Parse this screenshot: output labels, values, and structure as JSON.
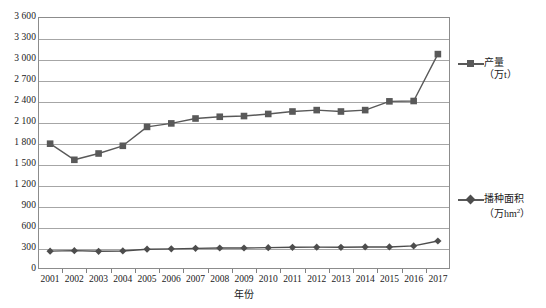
{
  "chart_data": {
    "type": "line",
    "title": "",
    "xlabel": "年份",
    "ylabel": "",
    "ylim": [
      0,
      3600
    ],
    "ystep": 300,
    "grid": true,
    "legend_position": "right",
    "categories": [
      "2001",
      "2002",
      "2003",
      "2004",
      "2005",
      "2006",
      "2007",
      "2008",
      "2009",
      "2010",
      "2011",
      "2012",
      "2013",
      "2014",
      "2015",
      "2016",
      "2017"
    ],
    "yticks": [
      "0",
      "300",
      "600",
      "900",
      "1 200",
      "1 500",
      "1 800",
      "2 100",
      "2 400",
      "2 700",
      "3 000",
      "3 300",
      "3 600"
    ],
    "series": [
      {
        "name": "产量",
        "unit": "（万t）",
        "marker": "square",
        "color": "#595959",
        "values": [
          1790,
          1560,
          1650,
          1760,
          2030,
          2080,
          2150,
          2175,
          2185,
          2215,
          2250,
          2270,
          2250,
          2270,
          2395,
          2400,
          3070
        ]
      },
      {
        "name": "播种面积",
        "unit": "（万hm²）",
        "marker": "diamond",
        "color": "#4d4d4d",
        "values": [
          255,
          262,
          253,
          258,
          283,
          288,
          295,
          300,
          300,
          305,
          310,
          312,
          310,
          315,
          315,
          330,
          400
        ]
      }
    ]
  },
  "legend": {
    "yield": {
      "name": "产量",
      "unit_prefix": "（万t",
      "unit_suffix": "）"
    },
    "area": {
      "name": "播种面积",
      "unit_prefix": "（万hm",
      "unit_exp": "2",
      "unit_suffix": "）"
    }
  },
  "axis": {
    "x_title": "年份"
  },
  "colors": {
    "series_yield": "#595959",
    "series_area": "#4d4d4d",
    "gridline": "#a6a6a6",
    "frame": "#8c8c8c",
    "text": "#1a1a1a"
  }
}
